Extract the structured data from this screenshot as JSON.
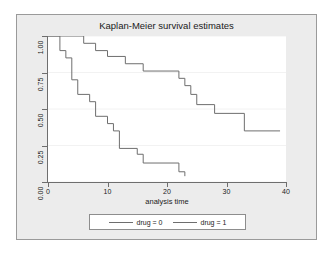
{
  "chart_data": {
    "type": "line",
    "title": "Kaplan-Meier survival estimates",
    "xlabel": "analysis time",
    "ylabel": "",
    "xlim": [
      0,
      40
    ],
    "ylim": [
      0,
      1
    ],
    "xticks": [
      "0",
      "10",
      "20",
      "30",
      "40"
    ],
    "xtick_values": [
      0,
      10,
      20,
      30,
      40
    ],
    "yticks": [
      "0.00",
      "0.25",
      "0.50",
      "0.75",
      "1.00"
    ],
    "ytick_values": [
      0.0,
      0.25,
      0.5,
      0.75,
      1.0
    ],
    "grid": "horizontal-faint",
    "legend_position": "bottom",
    "step_style": "post",
    "series": [
      {
        "name": "drug = 0",
        "color": "#6e6e6e",
        "x": [
          0,
          1,
          2,
          3,
          4,
          5,
          6,
          7,
          8,
          10,
          11,
          12,
          13,
          15,
          16,
          17,
          22,
          23
        ],
        "y": [
          1.0,
          1.0,
          0.9,
          0.85,
          0.7,
          0.6,
          0.6,
          0.55,
          0.45,
          0.4,
          0.35,
          0.23,
          0.23,
          0.19,
          0.13,
          0.13,
          0.13,
          0.06
        ],
        "points": [
          {
            "t": 0,
            "s": 1.0
          },
          {
            "t": 1,
            "s": 1.0
          },
          {
            "t": 2,
            "s": 0.9
          },
          {
            "t": 3,
            "s": 0.85
          },
          {
            "t": 4,
            "s": 0.7
          },
          {
            "t": 5,
            "s": 0.6
          },
          {
            "t": 7,
            "s": 0.55
          },
          {
            "t": 8,
            "s": 0.45
          },
          {
            "t": 10,
            "s": 0.4
          },
          {
            "t": 11,
            "s": 0.35
          },
          {
            "t": 12,
            "s": 0.23
          },
          {
            "t": 15,
            "s": 0.19
          },
          {
            "t": 16,
            "s": 0.13
          },
          {
            "t": 22,
            "s": 0.07
          },
          {
            "t": 23,
            "s": 0.04
          }
        ]
      },
      {
        "name": "drug = 1",
        "color": "#6e6e6e",
        "x": [
          0,
          6,
          8,
          10,
          13,
          16,
          22,
          23,
          24,
          25,
          28,
          33,
          39
        ],
        "y": [
          1.0,
          1.0,
          0.95,
          0.9,
          0.86,
          0.81,
          0.76,
          0.76,
          0.71,
          0.66,
          0.57,
          0.52,
          0.46
        ],
        "points": [
          {
            "t": 0,
            "s": 1.0
          },
          {
            "t": 6,
            "s": 0.95
          },
          {
            "t": 8,
            "s": 0.9
          },
          {
            "t": 10,
            "s": 0.86
          },
          {
            "t": 13,
            "s": 0.81
          },
          {
            "t": 16,
            "s": 0.76
          },
          {
            "t": 22,
            "s": 0.71
          },
          {
            "t": 23,
            "s": 0.66
          },
          {
            "t": 24,
            "s": 0.6
          },
          {
            "t": 25,
            "s": 0.53
          },
          {
            "t": 28,
            "s": 0.47
          },
          {
            "t": 33,
            "s": 0.35
          },
          {
            "t": 39,
            "s": 0.35
          }
        ]
      }
    ]
  },
  "title": {
    "text": "Kaplan-Meier survival estimates"
  },
  "axes": {
    "x_title": "analysis time",
    "x_ticks": [
      "0",
      "10",
      "20",
      "30",
      "40"
    ],
    "y_ticks": [
      "1.00",
      "0.75",
      "0.50",
      "0.25",
      "0.00"
    ]
  },
  "legend": {
    "entries": [
      {
        "label": "drug = 0"
      },
      {
        "label": "drug = 1"
      }
    ]
  },
  "colors": {
    "graph_background": "#ececec",
    "plot_background": "#ffffff",
    "line": "#6e6e6e",
    "axis": "#6e6e6e",
    "text": "#1a1a1a"
  }
}
